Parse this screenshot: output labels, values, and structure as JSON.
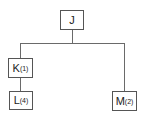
{
  "diagram": {
    "type": "tree",
    "nodes": [
      {
        "id": "J",
        "label": "J",
        "subscript": ""
      },
      {
        "id": "K",
        "label": "K",
        "subscript": "(1)"
      },
      {
        "id": "L",
        "label": "L",
        "subscript": "(4)"
      },
      {
        "id": "M",
        "label": "M",
        "subscript": "(2)"
      }
    ],
    "edges": [
      {
        "from": "J",
        "to": "K"
      },
      {
        "from": "J",
        "to": "M"
      },
      {
        "from": "K",
        "to": "L"
      }
    ],
    "colors": {
      "line": "#6a6a6a",
      "border": "#555555",
      "text": "#222222",
      "background": "#ffffff"
    }
  }
}
